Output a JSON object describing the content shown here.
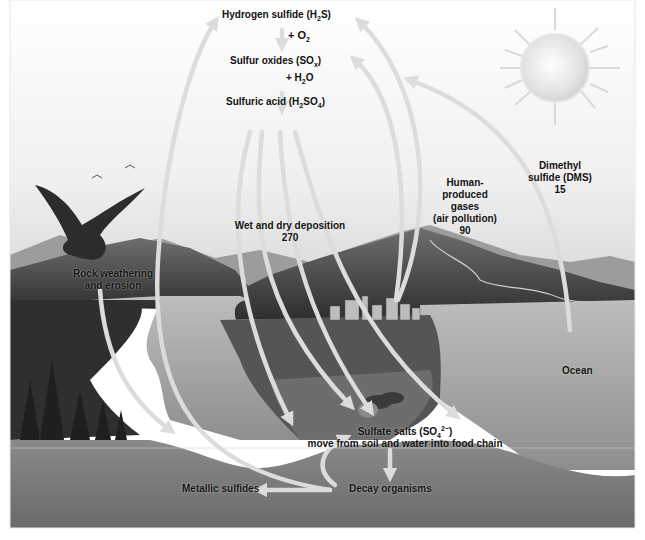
{
  "diagram": {
    "colors": {
      "sky": "#f4f4f4",
      "mountain_dark": "#3c3c3c",
      "mountain_mid": "#6a6a6a",
      "water": "#a9a9a9",
      "soil": "#7a7a7a",
      "arrow": "#d8d8d8",
      "text": "#111111"
    },
    "labels": {
      "hydrogen_sulfide": {
        "text": "Hydrogen sulfide (H",
        "sub": "2",
        "tail": "S)"
      },
      "plus_o2": {
        "text": "+ O",
        "sub": "2"
      },
      "sulfur_oxides": {
        "text": "Sulfur oxides (SO",
        "sub": "x",
        "tail": ")"
      },
      "plus_h2o": {
        "text": "+ H",
        "sub": "2",
        "tail": "O"
      },
      "sulfuric_acid": {
        "text": "Sulfuric acid (H",
        "sub": "2",
        "mid": "SO",
        "sub2": "4",
        "tail": ")"
      },
      "wet_dry_deposition": {
        "line1": "Wet and dry deposition",
        "value": "270"
      },
      "human_produced": {
        "line1": "Human-",
        "line2": "produced",
        "line3": "gases",
        "line4": "(air pollution)",
        "value": "90"
      },
      "dms": {
        "line1": "Dimethyl",
        "line2": "sulfide (DMS)",
        "value": "15"
      },
      "rock_weathering": {
        "line1": "Rock weathering",
        "line2": "and erosion"
      },
      "ocean": {
        "text": "Ocean"
      },
      "sulfate_salts": {
        "text": "Sulfate salts (SO",
        "sub": "4",
        "sup": "2−",
        "tail": ")",
        "line2": "move from soil and water into food chain"
      },
      "metallic_sulfides": {
        "text": "Metallic sulfides"
      },
      "decay_organisms": {
        "text": "Decay organisms"
      }
    },
    "icons": [
      "sun-icon",
      "eagle-icon",
      "birds-icon",
      "city-icon",
      "cows-icon",
      "forest-icon"
    ]
  }
}
